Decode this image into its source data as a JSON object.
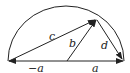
{
  "diagram": {
    "type": "semicircle-vectors",
    "labels": {
      "c": "c",
      "b": "b",
      "d": "d",
      "neg_a": "−a",
      "a": "a"
    },
    "colors": {
      "stroke": "#222222",
      "background": "#ffffff"
    }
  }
}
